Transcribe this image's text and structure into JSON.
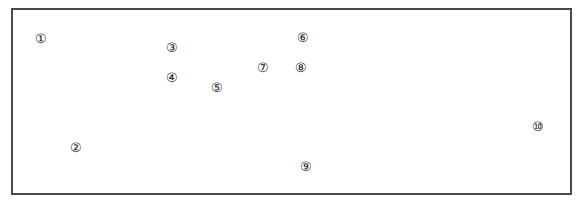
{
  "frame": {
    "border_color": "#4a4a4a"
  },
  "markers": [
    {
      "label": "①",
      "x": 41,
      "y": 38
    },
    {
      "label": "②",
      "x": 76,
      "y": 147
    },
    {
      "label": "③",
      "x": 172,
      "y": 47
    },
    {
      "label": "④",
      "x": 172,
      "y": 77
    },
    {
      "label": "⑤",
      "x": 217,
      "y": 87
    },
    {
      "label": "⑥",
      "x": 303,
      "y": 37
    },
    {
      "label": "⑦",
      "x": 263,
      "y": 67
    },
    {
      "label": "⑧",
      "x": 301,
      "y": 67
    },
    {
      "label": "⑨",
      "x": 306,
      "y": 166
    },
    {
      "label": "⑩",
      "x": 538,
      "y": 126
    }
  ]
}
